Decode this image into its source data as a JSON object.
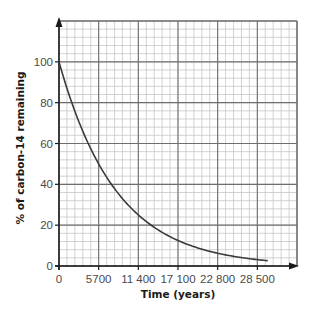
{
  "chart_data": {
    "type": "line",
    "title": "",
    "xlabel": "Time (years)",
    "ylabel": "% of carbon-14 remaining",
    "xlim": [
      0,
      34200
    ],
    "ylim": [
      0,
      120
    ],
    "x_ticks": [
      0,
      5700,
      11400,
      17100,
      22800,
      28500
    ],
    "x_tick_labels": [
      "0",
      "5700",
      "11 400",
      "17 100",
      "22 800",
      "28 500"
    ],
    "y_ticks": [
      0,
      20,
      40,
      60,
      80,
      100
    ],
    "y_tick_labels": [
      "0",
      "20",
      "40",
      "60",
      "80",
      "100"
    ],
    "grid": true,
    "grid_minor_divisions": 5,
    "legend": "none",
    "series": [
      {
        "name": "carbon-14 decay",
        "half_life_years": 5700,
        "x": [
          0,
          2850,
          5700,
          8550,
          11400,
          14250,
          17100,
          19950,
          22800,
          25650,
          28500,
          29900
        ],
        "y": [
          100,
          70.7,
          50,
          35.4,
          25,
          17.7,
          12.5,
          8.8,
          6.25,
          4.4,
          3.1,
          2.6
        ],
        "color": "#3a3a3a"
      }
    ],
    "colors": {
      "major_grid": "#6e6e6e",
      "minor_grid": "#c8c8c8",
      "axis": "#1a1a1a"
    }
  }
}
